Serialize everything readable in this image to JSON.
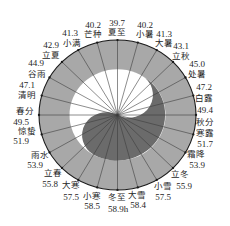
{
  "colors": {
    "ring": "#a8a8a8",
    "light": "#ffffff",
    "dark": "#6b6b6b",
    "line": "#3c3c3c",
    "outline": "#1a1a1a"
  },
  "terms": [
    {
      "name": "夏至",
      "value": "39.7"
    },
    {
      "name": "小暑",
      "value": "40.2"
    },
    {
      "name": "大暑",
      "value": "41.3"
    },
    {
      "name": "立秋",
      "value": "43.1"
    },
    {
      "name": "处暑",
      "value": "45.0"
    },
    {
      "name": "白露",
      "value": "47.2"
    },
    {
      "name": "秋分",
      "value": "49.4"
    },
    {
      "name": "寒露",
      "value": "51.7"
    },
    {
      "name": "霜降",
      "value": "53.9"
    },
    {
      "name": "立冬",
      "value": "55.9"
    },
    {
      "name": "小雪",
      "value": "57.5"
    },
    {
      "name": "大雪",
      "value": "58.4"
    },
    {
      "name": "冬至",
      "value": "58.9h"
    },
    {
      "name": "小寒",
      "value": "58.5"
    },
    {
      "name": "大寒",
      "value": "57.5"
    },
    {
      "name": "立春",
      "value": "55.8"
    },
    {
      "name": "雨水",
      "value": "53.9"
    },
    {
      "name": "惊蛰",
      "value": "51.9"
    },
    {
      "name": "春分",
      "value": "49.5"
    },
    {
      "name": "清明",
      "value": "47.1"
    },
    {
      "name": "谷雨",
      "value": "44.9"
    },
    {
      "name": "立夏",
      "value": "42.9"
    },
    {
      "name": "小满",
      "value": "41.3"
    },
    {
      "name": "芒种",
      "value": "40.2"
    }
  ]
}
